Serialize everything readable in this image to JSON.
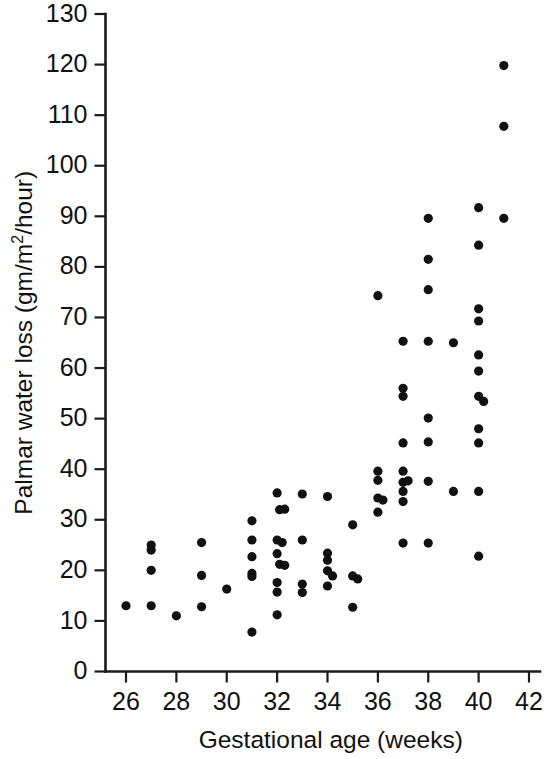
{
  "chart_data": {
    "type": "scatter",
    "title": "",
    "xlabel": "Gestational age (weeks)",
    "ylabel_prefix": "Palmar water loss (gm/m",
    "ylabel_sup": "2",
    "ylabel_suffix": "/hour)",
    "ylabel": "Palmar water loss (gm/m2/hour)",
    "xlim": [
      25,
      42.6
    ],
    "ylim": [
      0,
      130
    ],
    "xticks": [
      26,
      28,
      30,
      32,
      34,
      36,
      38,
      40,
      42
    ],
    "yticks": [
      0,
      10,
      20,
      30,
      40,
      50,
      60,
      70,
      80,
      90,
      100,
      110,
      120,
      130
    ],
    "xtick_labels": [
      "26",
      "28",
      "30",
      "32",
      "34",
      "36",
      "38",
      "40",
      "42"
    ],
    "ytick_labels": [
      "0",
      "10",
      "20",
      "30",
      "40",
      "50",
      "60",
      "70",
      "80",
      "90",
      "100",
      "110",
      "120",
      "130"
    ],
    "grid": false,
    "legend": "none",
    "marker": "filled-circle",
    "marker_color": "#111111",
    "marker_radius": 4.6,
    "points": [
      [
        26.0,
        13.0
      ],
      [
        27.0,
        25.0
      ],
      [
        27.0,
        24.0
      ],
      [
        27.0,
        20.0
      ],
      [
        27.0,
        13.0
      ],
      [
        28.0,
        11.0
      ],
      [
        29.0,
        25.5
      ],
      [
        29.0,
        19.0
      ],
      [
        29.0,
        12.8
      ],
      [
        30.0,
        16.3
      ],
      [
        31.0,
        29.8
      ],
      [
        31.0,
        26.0
      ],
      [
        31.0,
        22.7
      ],
      [
        31.0,
        19.4
      ],
      [
        31.0,
        18.8
      ],
      [
        31.0,
        7.8
      ],
      [
        32.0,
        35.3
      ],
      [
        32.1,
        32.0
      ],
      [
        32.3,
        32.1
      ],
      [
        32.0,
        26.0
      ],
      [
        32.2,
        25.5
      ],
      [
        32.0,
        23.3
      ],
      [
        32.1,
        21.2
      ],
      [
        32.3,
        21.0
      ],
      [
        32.0,
        17.6
      ],
      [
        32.0,
        15.7
      ],
      [
        32.0,
        11.2
      ],
      [
        33.0,
        35.1
      ],
      [
        33.0,
        26.0
      ],
      [
        33.0,
        17.3
      ],
      [
        33.0,
        15.6
      ],
      [
        34.0,
        34.6
      ],
      [
        34.0,
        23.4
      ],
      [
        34.0,
        22.0
      ],
      [
        34.0,
        19.9
      ],
      [
        34.2,
        18.9
      ],
      [
        34.0,
        16.9
      ],
      [
        35.0,
        29.0
      ],
      [
        35.0,
        18.9
      ],
      [
        35.2,
        18.3
      ],
      [
        35.0,
        12.7
      ],
      [
        36.0,
        74.3
      ],
      [
        36.0,
        39.6
      ],
      [
        36.0,
        37.8
      ],
      [
        36.0,
        34.3
      ],
      [
        36.2,
        33.9
      ],
      [
        36.0,
        31.5
      ],
      [
        37.0,
        65.3
      ],
      [
        37.0,
        56.0
      ],
      [
        37.0,
        54.4
      ],
      [
        37.0,
        45.2
      ],
      [
        37.0,
        39.6
      ],
      [
        37.2,
        37.7
      ],
      [
        37.0,
        37.4
      ],
      [
        37.0,
        35.6
      ],
      [
        37.0,
        33.6
      ],
      [
        37.0,
        25.4
      ],
      [
        38.0,
        89.6
      ],
      [
        38.0,
        81.5
      ],
      [
        38.0,
        75.5
      ],
      [
        38.0,
        65.3
      ],
      [
        38.0,
        50.1
      ],
      [
        38.0,
        45.4
      ],
      [
        38.0,
        37.6
      ],
      [
        38.0,
        25.4
      ],
      [
        39.0,
        65.0
      ],
      [
        39.0,
        35.6
      ],
      [
        40.0,
        91.7
      ],
      [
        40.0,
        84.3
      ],
      [
        40.0,
        71.7
      ],
      [
        40.0,
        69.3
      ],
      [
        40.0,
        62.6
      ],
      [
        40.0,
        59.4
      ],
      [
        40.0,
        54.4
      ],
      [
        40.2,
        53.4
      ],
      [
        40.0,
        48.0
      ],
      [
        40.0,
        45.2
      ],
      [
        40.0,
        35.6
      ],
      [
        40.0,
        22.8
      ],
      [
        41.0,
        119.8
      ],
      [
        41.0,
        107.8
      ],
      [
        41.0,
        89.6
      ]
    ]
  }
}
